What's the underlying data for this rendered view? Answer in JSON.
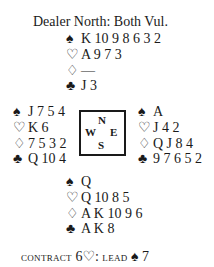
{
  "header": {
    "title": "Dealer North: Both Vul."
  },
  "icons": {
    "spade": "♠",
    "heart": "♡",
    "diamond": "♢",
    "club": "♣"
  },
  "hands": {
    "north": {
      "spades": "K 10 9 8 6 3 2",
      "hearts": "A 9 7 3",
      "diamonds": "—",
      "clubs": "J 3"
    },
    "west": {
      "spades": "J 7 5 4",
      "hearts": "K 6",
      "diamonds": "7 5 3 2",
      "clubs": "Q 10 4"
    },
    "east": {
      "spades": "A",
      "hearts": "J 4 2",
      "diamonds": "Q J 8 4",
      "clubs": "9 7 6 5 2"
    },
    "south": {
      "spades": "Q",
      "hearts": "Q 10 8 5",
      "diamonds": "A K 10 9 6",
      "clubs": "A K 8"
    }
  },
  "compass": {
    "north": "N",
    "west": "W",
    "east": "E",
    "south": "S"
  },
  "footer": {
    "contract_label": "CONTRACT",
    "contract_level": "6",
    "contract_suit": "♡",
    "separator": ":",
    "lead_label": "LEAD",
    "lead_suit": "♠",
    "lead_card": "7"
  }
}
